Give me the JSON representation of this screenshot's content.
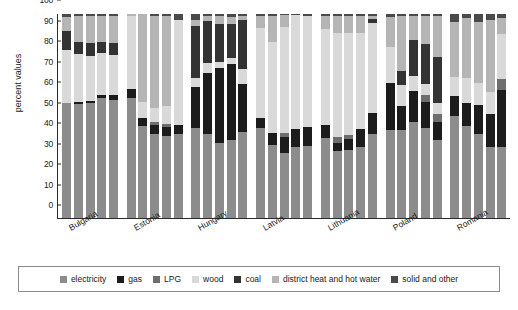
{
  "chart_data": {
    "type": "bar",
    "subtype": "stacked-bar-grouped",
    "title": "",
    "xlabel": "",
    "ylabel": "percent values",
    "ylim": [
      0,
      100
    ],
    "yticks": [
      0,
      10,
      20,
      30,
      40,
      50,
      60,
      70,
      80,
      90,
      100
    ],
    "grid": false,
    "legend_position": "bottom",
    "stack_order": [
      "electricity",
      "gas",
      "LPG",
      "wood",
      "coal",
      "district heat and hot water",
      "solid and other"
    ],
    "series": [
      {
        "name": "electricity",
        "color": "#8c8c8c"
      },
      {
        "name": "gas",
        "color": "#1c1c1c"
      },
      {
        "name": "LPG",
        "color": "#6e6e6e"
      },
      {
        "name": "wood",
        "color": "#d9d9d9"
      },
      {
        "name": "coal",
        "color": "#333333"
      },
      {
        "name": "district heat and hot water",
        "color": "#b5b5b5"
      },
      {
        "name": "solid and other",
        "color": "#4a4a4a"
      }
    ],
    "categories": [
      "Bulgaria",
      "Estonia",
      "Hungary",
      "Latvia",
      "Lithuania",
      "Poland",
      "Romania"
    ],
    "bars_per_category": 5,
    "groups": [
      {
        "category": "Bulgaria",
        "bars": [
          {
            "electricity": 56.5,
            "gas": 0.0,
            "LPG": 0.0,
            "wood": 26.0,
            "coal": 9.0,
            "district heat and hot water": 7.0,
            "solid and other": 1.5
          },
          {
            "electricity": 56.0,
            "gas": 1.0,
            "LPG": 0.0,
            "wood": 23.5,
            "coal": 6.0,
            "district heat and hot water": 12.5,
            "solid and other": 1.0
          },
          {
            "electricity": 56.5,
            "gas": 1.0,
            "LPG": 0.0,
            "wood": 22.0,
            "coal": 6.5,
            "district heat and hot water": 13.0,
            "solid and other": 1.0
          },
          {
            "electricity": 59.0,
            "gas": 1.5,
            "LPG": 0.0,
            "wood": 20.5,
            "coal": 5.5,
            "district heat and hot water": 12.5,
            "solid and other": 1.0
          },
          {
            "electricity": 58.0,
            "gas": 2.5,
            "LPG": 0.0,
            "wood": 19.5,
            "coal": 6.0,
            "district heat and hot water": 13.0,
            "solid and other": 1.0
          }
        ]
      },
      {
        "category": "Estonia",
        "bars": [
          {
            "electricity": 59.0,
            "gas": 4.0,
            "LPG": 0.0,
            "wood": 36.0,
            "coal": 0.0,
            "district heat and hot water": 1.0,
            "solid and other": 0.0
          },
          {
            "electricity": 45.0,
            "gas": 4.0,
            "LPG": 0.0,
            "wood": 8.0,
            "coal": 0.0,
            "district heat and hot water": 43.0,
            "solid and other": 0.0
          },
          {
            "electricity": 41.0,
            "gas": 4.5,
            "LPG": 1.5,
            "wood": 7.0,
            "coal": 0.0,
            "district heat and hot water": 45.0,
            "solid and other": 1.0
          },
          {
            "electricity": 40.0,
            "gas": 4.5,
            "LPG": 1.5,
            "wood": 9.0,
            "coal": 0.0,
            "district heat and hot water": 44.0,
            "solid and other": 1.0
          },
          {
            "electricity": 41.0,
            "gas": 4.5,
            "LPG": 0.0,
            "wood": 51.5,
            "coal": 0.0,
            "district heat and hot water": 0.0,
            "solid and other": 3.0
          }
        ]
      },
      {
        "category": "Hungary",
        "bars": [
          {
            "electricity": 44.0,
            "gas": 20.0,
            "LPG": 0.0,
            "wood": 4.5,
            "coal": 25.5,
            "district heat and hot water": 3.0,
            "solid and other": 3.0
          },
          {
            "electricity": 41.0,
            "gas": 30.0,
            "LPG": 0.0,
            "wood": 5.0,
            "coal": 20.5,
            "district heat and hot water": 2.5,
            "solid and other": 1.0
          },
          {
            "electricity": 37.0,
            "gas": 36.5,
            "LPG": 0.0,
            "wood": 3.0,
            "coal": 18.5,
            "district heat and hot water": 4.0,
            "solid and other": 1.0
          },
          {
            "electricity": 38.0,
            "gas": 37.5,
            "LPG": 0.0,
            "wood": 3.0,
            "coal": 16.5,
            "district heat and hot water": 3.5,
            "solid and other": 1.5
          },
          {
            "electricity": 42.0,
            "gas": 23.5,
            "LPG": 0.0,
            "wood": 7.5,
            "coal": 24.0,
            "district heat and hot water": 2.0,
            "solid and other": 1.0
          }
        ]
      },
      {
        "category": "Latvia",
        "bars": [
          {
            "electricity": 44.0,
            "gas": 5.0,
            "LPG": 0.0,
            "wood": 44.0,
            "coal": 0.0,
            "district heat and hot water": 6.0,
            "solid and other": 1.0
          },
          {
            "electricity": 36.0,
            "gas": 5.5,
            "LPG": 0.0,
            "wood": 45.0,
            "coal": 0.0,
            "district heat and hot water": 12.5,
            "solid and other": 1.0
          },
          {
            "electricity": 32.0,
            "gas": 7.5,
            "LPG": 2.0,
            "wood": 52.0,
            "coal": 0.0,
            "district heat and hot water": 6.0,
            "solid and other": 0.5
          },
          {
            "electricity": 35.0,
            "gas": 8.5,
            "LPG": 0.0,
            "wood": 56.0,
            "coal": 0.0,
            "district heat and hot water": 0.0,
            "solid and other": 0.5
          },
          {
            "electricity": 35.5,
            "gas": 9.0,
            "LPG": 0.0,
            "wood": 54.5,
            "coal": 0.0,
            "district heat and hot water": 0.0,
            "solid and other": 1.0
          }
        ]
      },
      {
        "category": "Lithuania",
        "bars": [
          {
            "electricity": 39.0,
            "gas": 6.5,
            "LPG": 0.0,
            "wood": 47.0,
            "coal": 0.0,
            "district heat and hot water": 6.5,
            "solid and other": 1.0
          },
          {
            "electricity": 33.0,
            "gas": 4.0,
            "LPG": 2.5,
            "wood": 51.0,
            "coal": 0.0,
            "district heat and hot water": 8.5,
            "solid and other": 1.0
          },
          {
            "electricity": 33.5,
            "gas": 5.0,
            "LPG": 2.0,
            "wood": 50.0,
            "coal": 0.0,
            "district heat and hot water": 8.5,
            "solid and other": 1.0
          },
          {
            "electricity": 35.0,
            "gas": 8.5,
            "LPG": 0.0,
            "wood": 47.0,
            "coal": 0.0,
            "district heat and hot water": 8.5,
            "solid and other": 1.0
          },
          {
            "electricity": 41.0,
            "gas": 10.5,
            "LPG": 0.0,
            "wood": 44.0,
            "coal": 2.0,
            "district heat and hot water": 1.5,
            "solid and other": 1.0
          }
        ]
      },
      {
        "category": "Poland",
        "bars": [
          {
            "electricity": 43.0,
            "gas": 23.0,
            "LPG": 0.0,
            "wood": 18.0,
            "coal": 0.0,
            "district heat and hot water": 14.5,
            "solid and other": 1.5
          },
          {
            "electricity": 43.0,
            "gas": 12.0,
            "LPG": 0.0,
            "wood": 10.0,
            "coal": 7.0,
            "district heat and hot water": 27.0,
            "solid and other": 1.0
          },
          {
            "electricity": 47.0,
            "gas": 15.5,
            "LPG": 0.0,
            "wood": 7.0,
            "coal": 18.0,
            "district heat and hot water": 11.5,
            "solid and other": 1.0
          },
          {
            "electricity": 44.0,
            "gas": 13.0,
            "LPG": 3.5,
            "wood": 5.0,
            "coal": 20.0,
            "district heat and hot water": 13.5,
            "solid and other": 1.0
          },
          {
            "electricity": 38.0,
            "gas": 9.0,
            "LPG": 4.0,
            "wood": 5.5,
            "coal": 22.5,
            "district heat and hot water": 20.0,
            "solid and other": 1.0
          }
        ]
      },
      {
        "category": "Romania",
        "bars": [
          {
            "electricity": 50.0,
            "gas": 10.0,
            "LPG": 0.0,
            "wood": 9.0,
            "coal": 0.0,
            "district heat and hot water": 27.0,
            "solid and other": 4.0
          },
          {
            "electricity": 45.0,
            "gas": 11.5,
            "LPG": 0.0,
            "wood": 12.0,
            "coal": 0.0,
            "district heat and hot water": 29.5,
            "solid and other": 2.0
          },
          {
            "electricity": 41.0,
            "gas": 14.5,
            "LPG": 0.0,
            "wood": 10.5,
            "coal": 0.0,
            "district heat and hot water": 30.0,
            "solid and other": 4.0
          },
          {
            "electricity": 35.0,
            "gas": 16.0,
            "LPG": 0.0,
            "wood": 11.0,
            "coal": 0.0,
            "district heat and hot water": 35.0,
            "solid and other": 3.0
          },
          {
            "electricity": 35.0,
            "gas": 28.0,
            "LPG": 5.0,
            "wood": 22.0,
            "coal": 0.0,
            "district heat and hot water": 8.0,
            "solid and other": 2.0
          }
        ]
      }
    ]
  },
  "axis": {
    "y_title": "percent values",
    "y_tick_labels": [
      "0",
      "10",
      "20",
      "30",
      "40",
      "50",
      "60",
      "70",
      "80",
      "90",
      "100"
    ],
    "x_tick_labels": [
      "Bulgaria",
      "Estonia",
      "Hungary",
      "Latvia",
      "Lithuania",
      "Poland",
      "Romania"
    ]
  },
  "legend": {
    "items": [
      {
        "label": "electricity",
        "color": "#8c8c8c"
      },
      {
        "label": "gas",
        "color": "#1c1c1c"
      },
      {
        "label": "LPG",
        "color": "#6e6e6e"
      },
      {
        "label": "wood",
        "color": "#d9d9d9"
      },
      {
        "label": "coal",
        "color": "#333333"
      },
      {
        "label": "district heat and hot water",
        "color": "#b5b5b5"
      },
      {
        "label": "solid and other",
        "color": "#4a4a4a"
      }
    ]
  }
}
